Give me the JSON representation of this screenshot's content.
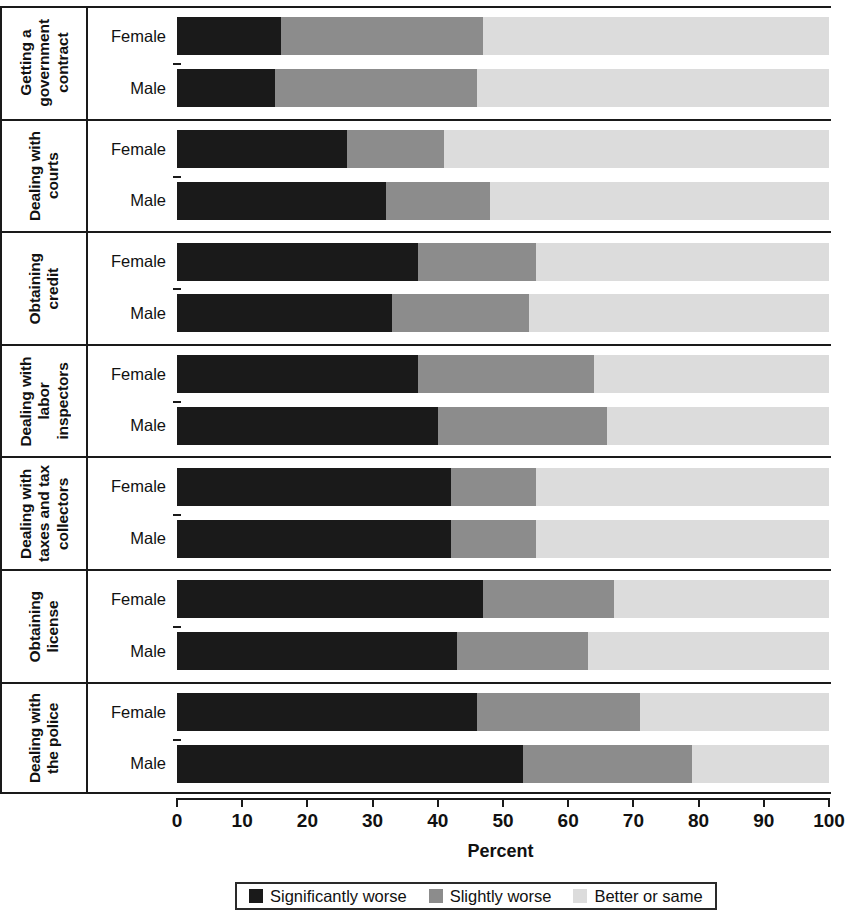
{
  "chart_data": {
    "type": "bar",
    "subtype": "horizontal-stacked-100",
    "title": "",
    "xlabel": "Percent",
    "ylabel": "",
    "xlim": [
      0,
      100
    ],
    "xticks": [
      0,
      10,
      20,
      30,
      40,
      50,
      60,
      70,
      80,
      90,
      100
    ],
    "xtick_labels": [
      "0",
      "10",
      "20",
      "30",
      "40",
      "50",
      "60",
      "70",
      "80",
      "90",
      "100"
    ],
    "grid": false,
    "legend_position": "bottom",
    "series": [
      {
        "name": "Significantly worse",
        "color": "#1a1a1a"
      },
      {
        "name": "Slightly worse",
        "color": "#8c8c8c"
      },
      {
        "name": "Better or same",
        "color": "#dcdcdc"
      }
    ],
    "groups": [
      {
        "category": "Getting a\ngovernment\ncontract",
        "rows": [
          {
            "label": "Female",
            "values": [
              16,
              31,
              53
            ]
          },
          {
            "label": "Male",
            "values": [
              15,
              31,
              54
            ]
          }
        ]
      },
      {
        "category": "Dealing with\ncourts",
        "rows": [
          {
            "label": "Female",
            "values": [
              26,
              15,
              59
            ]
          },
          {
            "label": "Male",
            "values": [
              32,
              16,
              52
            ]
          }
        ]
      },
      {
        "category": "Obtaining\ncredit",
        "rows": [
          {
            "label": "Female",
            "values": [
              37,
              18,
              45
            ]
          },
          {
            "label": "Male",
            "values": [
              33,
              21,
              46
            ]
          }
        ]
      },
      {
        "category": "Dealing with labor\ninspectors",
        "rows": [
          {
            "label": "Female",
            "values": [
              37,
              27,
              36
            ]
          },
          {
            "label": "Male",
            "values": [
              40,
              26,
              34
            ]
          }
        ]
      },
      {
        "category": "Dealing with\ntaxes and tax\ncollectors",
        "rows": [
          {
            "label": "Female",
            "values": [
              42,
              13,
              45
            ]
          },
          {
            "label": "Male",
            "values": [
              42,
              13,
              45
            ]
          }
        ]
      },
      {
        "category": "Obtaining\nlicense",
        "rows": [
          {
            "label": "Female",
            "values": [
              47,
              20,
              33
            ]
          },
          {
            "label": "Male",
            "values": [
              43,
              20,
              37
            ]
          }
        ]
      },
      {
        "category": "Dealing with\nthe police",
        "rows": [
          {
            "label": "Female",
            "values": [
              46,
              25,
              29
            ]
          },
          {
            "label": "Male",
            "values": [
              53,
              26,
              21
            ]
          }
        ]
      }
    ]
  },
  "axis": {
    "x_title": "Percent"
  },
  "legend": {
    "items": [
      {
        "label": "Significantly worse",
        "color": "#1a1a1a"
      },
      {
        "label": "Slightly worse",
        "color": "#8c8c8c"
      },
      {
        "label": "Better or same",
        "color": "#dcdcdc"
      }
    ]
  }
}
